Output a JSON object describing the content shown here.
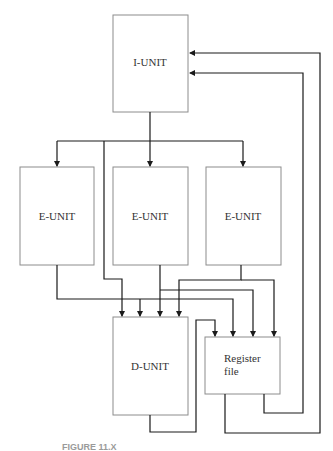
{
  "diagram": {
    "nodes": {
      "i_unit": {
        "label": "I-UNIT"
      },
      "e_unit_1": {
        "label": "E-UNIT"
      },
      "e_unit_2": {
        "label": "E-UNIT"
      },
      "e_unit_3": {
        "label": "E-UNIT"
      },
      "d_unit": {
        "label": "D-UNIT"
      },
      "register_file": {
        "label_line1": "Register",
        "label_line2": "file"
      }
    },
    "caption": "FIGURE 11.X",
    "colors": {
      "box_border": "#8c8c8c",
      "wire": "#1a1a1a",
      "text": "#333333"
    }
  }
}
